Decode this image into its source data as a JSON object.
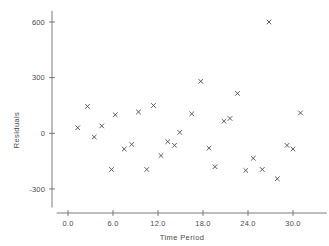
{
  "chart_data": {
    "type": "scatter",
    "title": "",
    "xlabel": "Time Period",
    "ylabel": "Residuals",
    "xlim": [
      -1.5,
      34.5
    ],
    "ylim": [
      -400,
      660
    ],
    "grid": false,
    "legend": null,
    "marker": "x",
    "xticks": [
      "0.0",
      "6.0",
      "12.0",
      "18.0",
      "24.0",
      "30.0"
    ],
    "xtick_values": [
      0,
      6,
      12,
      18,
      24,
      30
    ],
    "yticks": [
      "600",
      "300",
      "0",
      "-300"
    ],
    "ytick_values": [
      600,
      300,
      0,
      -300
    ],
    "x": [
      1.3,
      2.6,
      3.5,
      4.5,
      6.3,
      7.5,
      8.5,
      9.4,
      10.5,
      11.4,
      12.4,
      13.3,
      14.2,
      14.9,
      16.5,
      17.7,
      18.8,
      19.6,
      20.8,
      21.6,
      22.6,
      23.7,
      24.7,
      25.9,
      26.8,
      27.9,
      29.2,
      30.0,
      31.0
    ],
    "y": [
      30,
      145,
      -20,
      40,
      100,
      -85,
      -60,
      115,
      -195,
      150,
      -120,
      -45,
      -65,
      5,
      105,
      280,
      -80,
      -180,
      65,
      80,
      215,
      -200,
      -135,
      -195,
      600,
      -245,
      -65,
      -85,
      110
    ],
    "points": [
      {
        "x": 1.3,
        "y": 30
      },
      {
        "x": 2.6,
        "y": 145
      },
      {
        "x": 3.5,
        "y": -20
      },
      {
        "x": 4.5,
        "y": 40
      },
      {
        "x": 6.3,
        "y": 100
      },
      {
        "x": 5.8,
        "y": -195
      },
      {
        "x": 7.5,
        "y": -85
      },
      {
        "x": 8.5,
        "y": -60
      },
      {
        "x": 9.4,
        "y": 115
      },
      {
        "x": 10.5,
        "y": -195
      },
      {
        "x": 11.4,
        "y": 150
      },
      {
        "x": 12.4,
        "y": -120
      },
      {
        "x": 13.3,
        "y": -45
      },
      {
        "x": 14.2,
        "y": -65
      },
      {
        "x": 14.9,
        "y": 5
      },
      {
        "x": 16.5,
        "y": 105
      },
      {
        "x": 17.7,
        "y": 280
      },
      {
        "x": 18.8,
        "y": -80
      },
      {
        "x": 19.6,
        "y": -180
      },
      {
        "x": 20.8,
        "y": 65
      },
      {
        "x": 21.6,
        "y": 80
      },
      {
        "x": 22.6,
        "y": 215
      },
      {
        "x": 23.7,
        "y": -200
      },
      {
        "x": 24.7,
        "y": -135
      },
      {
        "x": 25.9,
        "y": -195
      },
      {
        "x": 26.8,
        "y": 600
      },
      {
        "x": 27.9,
        "y": -245
      },
      {
        "x": 29.2,
        "y": -65
      },
      {
        "x": 30.0,
        "y": -85
      },
      {
        "x": 31.0,
        "y": 110
      }
    ]
  }
}
